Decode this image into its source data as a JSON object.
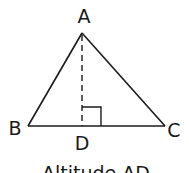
{
  "diagram": {
    "type": "triangle-with-altitude",
    "vertices": {
      "A": {
        "label": "A",
        "x": 82,
        "y": 33
      },
      "B": {
        "label": "B",
        "x": 28,
        "y": 126
      },
      "C": {
        "label": "C",
        "x": 165,
        "y": 126
      },
      "D": {
        "label": "D",
        "x": 82,
        "y": 126
      }
    },
    "altitude": {
      "from": "A",
      "to": "D",
      "style": "dashed"
    },
    "right_angle_marker": {
      "at": "D",
      "size": 19
    },
    "caption": "Altitude AD",
    "colors": {
      "stroke": "#1a1a1a",
      "background": "#ffffff"
    }
  }
}
